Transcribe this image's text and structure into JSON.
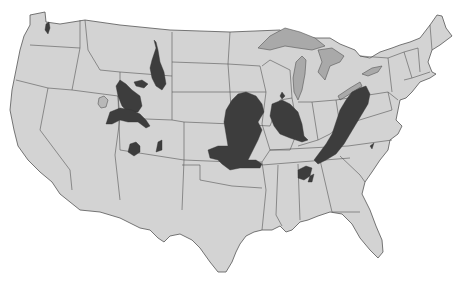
{
  "map": {
    "subject": "Contiguous United States with shaded regions",
    "colors": {
      "background": "#ffffff",
      "land": "#d3d3d3",
      "borders": "#555555",
      "lakes": "#a9a9a9",
      "shaded_regions": "#3d3d3d"
    },
    "shaded_regions": [
      {
        "id": "western-washington",
        "approx_location": "Western Washington"
      },
      {
        "id": "powder-river-basin",
        "approx_location": "SE Montana / NE Wyoming"
      },
      {
        "id": "wind-river-small",
        "approx_location": "Central Wyoming"
      },
      {
        "id": "green-river",
        "approx_location": "SW Wyoming / NW Colorado"
      },
      {
        "id": "uinta",
        "approx_location": "Utah / Western Colorado"
      },
      {
        "id": "san-juan",
        "approx_location": "NW New Mexico / SW Colorado"
      },
      {
        "id": "raton",
        "approx_location": "S Colorado / NE New Mexico"
      },
      {
        "id": "western-interior",
        "approx_location": "Iowa / Missouri / Kansas / Oklahoma"
      },
      {
        "id": "illinois-basin",
        "approx_location": "Illinois / Indiana / Kentucky"
      },
      {
        "id": "appalachian",
        "approx_location": "Pennsylvania / Ohio / West Virginia / Kentucky / Tennessee"
      },
      {
        "id": "warrior-basin",
        "approx_location": "Alabama"
      },
      {
        "id": "richmond-basin",
        "approx_location": "Virginia"
      },
      {
        "id": "michigan-small",
        "approx_location": "Central Michigan"
      }
    ]
  }
}
